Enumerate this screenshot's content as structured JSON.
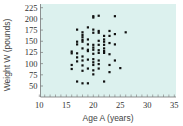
{
  "chart_data": {
    "type": "scatter",
    "title": "",
    "xlabel": "Age A (years)",
    "ylabel": "Weight W (pounds)",
    "xlim": [
      10,
      35
    ],
    "ylim": [
      25,
      225
    ],
    "x_ticks": [
      10,
      15,
      20,
      25,
      30,
      35
    ],
    "y_ticks": [
      50,
      75,
      100,
      125,
      150,
      175,
      200,
      225
    ],
    "x_minor_step": 1,
    "grid": false,
    "legend": null,
    "background_color": "#dcf1ee",
    "point_color": "#111111",
    "points": [
      [
        16,
        127
      ],
      [
        16,
        123
      ],
      [
        16,
        97
      ],
      [
        16,
        88
      ],
      [
        17,
        176
      ],
      [
        17,
        149
      ],
      [
        17,
        143
      ],
      [
        17,
        123
      ],
      [
        17,
        114
      ],
      [
        17,
        105
      ],
      [
        17,
        60
      ],
      [
        18,
        170
      ],
      [
        18,
        164
      ],
      [
        18,
        159
      ],
      [
        18,
        153
      ],
      [
        18,
        149
      ],
      [
        18,
        134
      ],
      [
        18,
        116
      ],
      [
        18,
        107
      ],
      [
        18,
        96
      ],
      [
        18,
        84
      ],
      [
        18,
        56
      ],
      [
        19,
        181
      ],
      [
        19,
        154
      ],
      [
        19,
        143
      ],
      [
        19,
        131
      ],
      [
        19,
        128
      ],
      [
        19,
        109
      ],
      [
        19,
        89
      ],
      [
        19,
        56
      ],
      [
        20,
        206
      ],
      [
        20,
        203
      ],
      [
        20,
        176
      ],
      [
        20,
        169
      ],
      [
        20,
        142
      ],
      [
        20,
        136
      ],
      [
        20,
        131
      ],
      [
        20,
        122
      ],
      [
        20,
        110
      ],
      [
        20,
        103
      ],
      [
        20,
        97
      ],
      [
        20,
        85
      ],
      [
        20,
        76
      ],
      [
        21,
        207
      ],
      [
        21,
        173
      ],
      [
        21,
        169
      ],
      [
        21,
        151
      ],
      [
        21,
        142
      ],
      [
        21,
        130
      ],
      [
        21,
        124
      ],
      [
        21,
        107
      ],
      [
        21,
        99
      ],
      [
        21,
        89
      ],
      [
        22,
        162
      ],
      [
        22,
        154
      ],
      [
        22,
        149
      ],
      [
        22,
        142
      ],
      [
        22,
        134
      ],
      [
        22,
        128
      ],
      [
        22,
        124
      ],
      [
        22,
        60
      ],
      [
        23,
        173
      ],
      [
        23,
        162
      ],
      [
        23,
        146
      ],
      [
        23,
        121
      ],
      [
        23,
        97
      ],
      [
        23,
        81
      ],
      [
        24,
        206
      ],
      [
        24,
        166
      ],
      [
        24,
        143
      ],
      [
        24,
        107
      ],
      [
        25,
        90
      ],
      [
        26,
        170
      ]
    ]
  },
  "axes": {
    "x_label": "Age A (years)",
    "y_label": "Weight W (pounds)"
  }
}
